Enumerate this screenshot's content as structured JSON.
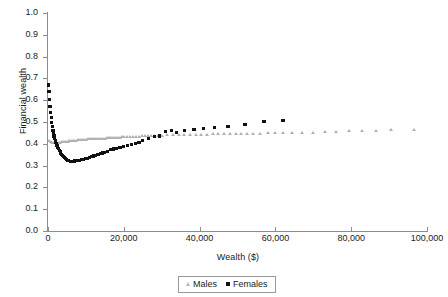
{
  "chart_data": {
    "type": "scatter",
    "title": "",
    "xlabel": "Wealth ($)",
    "ylabel": "Financial wealth",
    "xlim": [
      0,
      100000
    ],
    "ylim": [
      0.0,
      1.0
    ],
    "xticks": [
      0,
      20000,
      40000,
      60000,
      80000,
      100000
    ],
    "xtick_labels": [
      "0",
      "20,000",
      "40,000",
      "60,000",
      "80,000",
      "100,000"
    ],
    "yticks": [
      0.0,
      0.1,
      0.2,
      0.3,
      0.4,
      0.5,
      0.6,
      0.7,
      0.8,
      0.9,
      1.0
    ],
    "ytick_labels": [
      "0.0",
      "0.1",
      "0.2",
      "0.3",
      "0.4",
      "0.5",
      "0.6",
      "0.7",
      "0.8",
      "0.9",
      "1.0"
    ],
    "grid": false,
    "legend_position": "bottom-center",
    "colors": {
      "males": "#b0b0b0",
      "females": "#111111",
      "axis": "#8c8c8c"
    },
    "series": [
      {
        "name": "Males",
        "marker": "triangle",
        "color": "#b0b0b0",
        "points": [
          [
            400,
            0.412
          ],
          [
            800,
            0.408
          ],
          [
            1200,
            0.405
          ],
          [
            1600,
            0.404
          ],
          [
            2000,
            0.403
          ],
          [
            2400,
            0.404
          ],
          [
            2800,
            0.405
          ],
          [
            3200,
            0.406
          ],
          [
            3600,
            0.407
          ],
          [
            4000,
            0.408
          ],
          [
            4400,
            0.409
          ],
          [
            4800,
            0.41
          ],
          [
            5200,
            0.411
          ],
          [
            5600,
            0.412
          ],
          [
            6000,
            0.413
          ],
          [
            6500,
            0.414
          ],
          [
            7000,
            0.415
          ],
          [
            7500,
            0.416
          ],
          [
            8000,
            0.417
          ],
          [
            8500,
            0.418
          ],
          [
            9000,
            0.419
          ],
          [
            9500,
            0.42
          ],
          [
            10000,
            0.42
          ],
          [
            10500,
            0.421
          ],
          [
            11000,
            0.421
          ],
          [
            11500,
            0.422
          ],
          [
            12000,
            0.422
          ],
          [
            12500,
            0.423
          ],
          [
            13000,
            0.423
          ],
          [
            13500,
            0.424
          ],
          [
            14000,
            0.424
          ],
          [
            14500,
            0.425
          ],
          [
            15000,
            0.425
          ],
          [
            15500,
            0.426
          ],
          [
            16000,
            0.426
          ],
          [
            16500,
            0.427
          ],
          [
            17000,
            0.427
          ],
          [
            17500,
            0.428
          ],
          [
            18000,
            0.428
          ],
          [
            18500,
            0.429
          ],
          [
            19000,
            0.429
          ],
          [
            19500,
            0.43
          ],
          [
            20000,
            0.43
          ],
          [
            20800,
            0.431
          ],
          [
            21600,
            0.432
          ],
          [
            22400,
            0.433
          ],
          [
            23200,
            0.434
          ],
          [
            24000,
            0.434
          ],
          [
            24800,
            0.435
          ],
          [
            25600,
            0.436
          ],
          [
            26400,
            0.436
          ],
          [
            27200,
            0.437
          ],
          [
            28000,
            0.437
          ],
          [
            29000,
            0.438
          ],
          [
            30000,
            0.438
          ],
          [
            31500,
            0.439
          ],
          [
            33000,
            0.44
          ],
          [
            34500,
            0.44
          ],
          [
            36000,
            0.441
          ],
          [
            37500,
            0.441
          ],
          [
            39000,
            0.442
          ],
          [
            40500,
            0.443
          ],
          [
            42000,
            0.443
          ],
          [
            43500,
            0.444
          ],
          [
            45000,
            0.444
          ],
          [
            46500,
            0.445
          ],
          [
            48000,
            0.445
          ],
          [
            49500,
            0.446
          ],
          [
            51000,
            0.446
          ],
          [
            52500,
            0.447
          ],
          [
            54000,
            0.447
          ],
          [
            56000,
            0.448
          ],
          [
            58000,
            0.449
          ],
          [
            60000,
            0.449
          ],
          [
            62000,
            0.45
          ],
          [
            64500,
            0.451
          ],
          [
            67000,
            0.452
          ],
          [
            70000,
            0.452
          ],
          [
            73000,
            0.455
          ],
          [
            76000,
            0.456
          ],
          [
            79500,
            0.459
          ],
          [
            83000,
            0.459
          ],
          [
            86500,
            0.461
          ],
          [
            90500,
            0.462
          ],
          [
            96500,
            0.463
          ]
        ]
      },
      {
        "name": "Females",
        "marker": "square",
        "color": "#111111",
        "points": [
          [
            100,
            0.67
          ],
          [
            250,
            0.64
          ],
          [
            400,
            0.605
          ],
          [
            550,
            0.572
          ],
          [
            700,
            0.545
          ],
          [
            850,
            0.52
          ],
          [
            1000,
            0.498
          ],
          [
            1150,
            0.478
          ],
          [
            1300,
            0.462
          ],
          [
            1450,
            0.448
          ],
          [
            1600,
            0.436
          ],
          [
            1750,
            0.425
          ],
          [
            1900,
            0.416
          ],
          [
            2050,
            0.408
          ],
          [
            2200,
            0.4
          ],
          [
            2400,
            0.392
          ],
          [
            2600,
            0.384
          ],
          [
            2800,
            0.377
          ],
          [
            3000,
            0.37
          ],
          [
            3200,
            0.364
          ],
          [
            3400,
            0.358
          ],
          [
            3600,
            0.352
          ],
          [
            3800,
            0.347
          ],
          [
            4000,
            0.342
          ],
          [
            4300,
            0.336
          ],
          [
            4600,
            0.331
          ],
          [
            4900,
            0.327
          ],
          [
            5200,
            0.324
          ],
          [
            5500,
            0.322
          ],
          [
            5900,
            0.32
          ],
          [
            6300,
            0.32
          ],
          [
            6700,
            0.32
          ],
          [
            7100,
            0.321
          ],
          [
            7500,
            0.322
          ],
          [
            7900,
            0.323
          ],
          [
            8400,
            0.325
          ],
          [
            8900,
            0.327
          ],
          [
            9400,
            0.329
          ],
          [
            9900,
            0.331
          ],
          [
            10400,
            0.334
          ],
          [
            10900,
            0.337
          ],
          [
            11400,
            0.34
          ],
          [
            12000,
            0.344
          ],
          [
            12600,
            0.348
          ],
          [
            13200,
            0.352
          ],
          [
            13800,
            0.355
          ],
          [
            14400,
            0.358
          ],
          [
            15000,
            0.36
          ],
          [
            15700,
            0.364
          ],
          [
            16400,
            0.372
          ],
          [
            17200,
            0.376
          ],
          [
            18000,
            0.378
          ],
          [
            19000,
            0.382
          ],
          [
            20000,
            0.388
          ],
          [
            21000,
            0.391
          ],
          [
            22000,
            0.395
          ],
          [
            23000,
            0.4
          ],
          [
            24000,
            0.406
          ],
          [
            25000,
            0.414
          ],
          [
            26500,
            0.426
          ],
          [
            28000,
            0.434
          ],
          [
            29500,
            0.436
          ],
          [
            31000,
            0.455
          ],
          [
            32500,
            0.46
          ],
          [
            34000,
            0.452
          ],
          [
            36000,
            0.462
          ],
          [
            38500,
            0.466
          ],
          [
            41000,
            0.47
          ],
          [
            44000,
            0.476
          ],
          [
            47500,
            0.48
          ],
          [
            52000,
            0.49
          ],
          [
            57000,
            0.502
          ],
          [
            62000,
            0.508
          ]
        ]
      }
    ]
  },
  "legend": {
    "items": [
      {
        "label": "Males",
        "marker": "triangle"
      },
      {
        "label": "Females",
        "marker": "square"
      }
    ]
  }
}
